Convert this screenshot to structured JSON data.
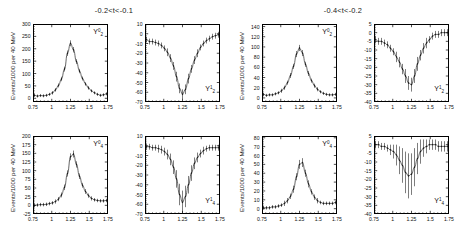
{
  "figure": {
    "ylabel_text": "Events/1000 per 40 MeV",
    "xtick_labels": [
      "0.75",
      "1",
      "1.25",
      "1.5",
      "1.75"
    ],
    "xlim": [
      0.75,
      1.75
    ]
  },
  "groups": [
    {
      "title": "-0.2<t<-0.1",
      "panels": [
        {
          "moment_base": "Y",
          "moment_l": "2",
          "moment_m": "0",
          "yticks": [
            "300",
            "250",
            "200",
            "150",
            "100",
            "50",
            "0"
          ],
          "ylim": [
            -15,
            300
          ],
          "chart_data": {
            "type": "line",
            "title": "Y20 moment, -0.2<t<-0.1",
            "xlabel": "",
            "ylabel": "Events/1000 per 40 MeV",
            "xlim": [
              0.75,
              1.75
            ],
            "ylim": [
              -15,
              300
            ],
            "x": [
              0.77,
              0.81,
              0.85,
              0.89,
              0.93,
              0.97,
              1.01,
              1.05,
              1.09,
              1.13,
              1.17,
              1.21,
              1.25,
              1.29,
              1.33,
              1.37,
              1.41,
              1.45,
              1.49,
              1.53,
              1.57,
              1.61,
              1.65,
              1.69,
              1.73
            ],
            "values": [
              12,
              9,
              11,
              10,
              12,
              16,
              22,
              34,
              52,
              78,
              118,
              182,
              222,
              196,
              148,
              110,
              80,
              58,
              42,
              30,
              22,
              16,
              12,
              14,
              18
            ],
            "errors": [
              6,
              6,
              6,
              6,
              6,
              6,
              7,
              7,
              8,
              9,
              10,
              11,
              12,
              11,
              10,
              9,
              8,
              7,
              7,
              6,
              6,
              6,
              6,
              6,
              6
            ]
          }
        },
        {
          "moment_base": "Y",
          "moment_l": "2",
          "moment_m": "1",
          "yticks": [
            "10",
            "0",
            "-10",
            "-20",
            "-30",
            "-40",
            "-50",
            "-60",
            "-70"
          ],
          "ylim": [
            -70,
            10
          ],
          "chart_data": {
            "type": "line",
            "title": "Y21 moment, -0.2<t<-0.1",
            "xlabel": "",
            "ylabel": "Events/1000 per 40 MeV",
            "xlim": [
              0.75,
              1.75
            ],
            "ylim": [
              -70,
              10
            ],
            "x": [
              0.77,
              0.81,
              0.85,
              0.89,
              0.93,
              0.97,
              1.01,
              1.05,
              1.09,
              1.13,
              1.17,
              1.21,
              1.25,
              1.29,
              1.33,
              1.37,
              1.41,
              1.45,
              1.49,
              1.53,
              1.57,
              1.61,
              1.65,
              1.69,
              1.73
            ],
            "values": [
              -6,
              -8,
              -8,
              -9,
              -10,
              -12,
              -15,
              -19,
              -25,
              -33,
              -44,
              -56,
              -62,
              -57,
              -46,
              -36,
              -27,
              -20,
              -14,
              -10,
              -7,
              -5,
              -3,
              -2,
              -1
            ],
            "errors": [
              3,
              3,
              3,
              3,
              3,
              3,
              3,
              4,
              4,
              4,
              5,
              5,
              5,
              5,
              5,
              4,
              4,
              4,
              3,
              3,
              3,
              3,
              3,
              3,
              3
            ]
          }
        },
        {
          "moment_base": "Y",
          "moment_l": "4",
          "moment_m": "0",
          "yticks": [
            "200",
            "175",
            "150",
            "125",
            "100",
            "75",
            "50",
            "25",
            "0",
            "-25"
          ],
          "ylim": [
            -25,
            200
          ],
          "chart_data": {
            "type": "line",
            "title": "Y40 moment, -0.2<t<-0.1",
            "xlabel": "",
            "ylabel": "Events/1000 per 40 MeV",
            "xlim": [
              0.75,
              1.75
            ],
            "ylim": [
              -25,
              200
            ],
            "x": [
              0.77,
              0.81,
              0.85,
              0.89,
              0.93,
              0.97,
              1.01,
              1.05,
              1.09,
              1.13,
              1.17,
              1.21,
              1.25,
              1.29,
              1.33,
              1.37,
              1.41,
              1.45,
              1.49,
              1.53,
              1.57,
              1.61,
              1.65,
              1.69,
              1.73
            ],
            "values": [
              0,
              1,
              2,
              2,
              3,
              5,
              7,
              11,
              18,
              30,
              52,
              92,
              140,
              148,
              118,
              84,
              58,
              40,
              28,
              20,
              16,
              14,
              13,
              13,
              14
            ],
            "errors": [
              5,
              5,
              5,
              5,
              5,
              5,
              5,
              6,
              6,
              7,
              8,
              9,
              10,
              10,
              9,
              8,
              7,
              7,
              6,
              6,
              5,
              5,
              5,
              5,
              5
            ]
          }
        },
        {
          "moment_base": "Y",
          "moment_l": "4",
          "moment_m": "1",
          "yticks": [
            "10",
            "0",
            "-10",
            "-20",
            "-30",
            "-40",
            "-50",
            "-60",
            "-70"
          ],
          "ylim": [
            -70,
            10
          ],
          "chart_data": {
            "type": "line",
            "title": "Y41 moment, -0.2<t<-0.1",
            "xlabel": "",
            "ylabel": "Events/1000 per 40 MeV",
            "xlim": [
              0.75,
              1.75
            ],
            "ylim": [
              -70,
              10
            ],
            "x": [
              0.77,
              0.81,
              0.85,
              0.89,
              0.93,
              0.97,
              1.01,
              1.05,
              1.09,
              1.13,
              1.17,
              1.21,
              1.25,
              1.29,
              1.33,
              1.37,
              1.41,
              1.45,
              1.49,
              1.53,
              1.57,
              1.61,
              1.65,
              1.69,
              1.73
            ],
            "values": [
              -1,
              -1,
              -2,
              -2,
              -3,
              -4,
              -6,
              -9,
              -14,
              -22,
              -34,
              -50,
              -58,
              -52,
              -40,
              -28,
              -18,
              -12,
              -8,
              -5,
              -3,
              -2,
              -2,
              -2,
              -2
            ],
            "errors": [
              3,
              3,
              3,
              3,
              4,
              4,
              4,
              5,
              6,
              7,
              9,
              11,
              12,
              11,
              9,
              8,
              6,
              5,
              4,
              4,
              3,
              3,
              3,
              3,
              3
            ]
          }
        }
      ]
    },
    {
      "title": "-0.4<t<-0.2",
      "panels": [
        {
          "moment_base": "Y",
          "moment_l": "2",
          "moment_m": "0",
          "yticks": [
            "140",
            "120",
            "100",
            "80",
            "60",
            "40",
            "20",
            "0"
          ],
          "ylim": [
            -8,
            145
          ],
          "chart_data": {
            "type": "line",
            "title": "Y20 moment, -0.4<t<-0.2",
            "xlabel": "",
            "ylabel": "Events/1000 per 40 MeV",
            "xlim": [
              0.75,
              1.75
            ],
            "ylim": [
              -8,
              145
            ],
            "x": [
              0.77,
              0.81,
              0.85,
              0.89,
              0.93,
              0.97,
              1.01,
              1.05,
              1.09,
              1.13,
              1.17,
              1.21,
              1.25,
              1.29,
              1.33,
              1.37,
              1.41,
              1.45,
              1.49,
              1.53,
              1.57,
              1.61,
              1.65,
              1.69,
              1.73
            ],
            "values": [
              7,
              5,
              6,
              6,
              8,
              10,
              14,
              20,
              30,
              44,
              62,
              86,
              98,
              88,
              66,
              48,
              34,
              24,
              17,
              12,
              9,
              7,
              6,
              6,
              7
            ],
            "errors": [
              3,
              3,
              3,
              3,
              3,
              3,
              4,
              4,
              4,
              5,
              5,
              6,
              6,
              6,
              5,
              5,
              4,
              4,
              4,
              3,
              3,
              3,
              3,
              3,
              3
            ]
          }
        },
        {
          "moment_base": "Y",
          "moment_l": "2",
          "moment_m": "1",
          "yticks": [
            "5",
            "0",
            "-5",
            "-10",
            "-15",
            "-20",
            "-25",
            "-30",
            "-35",
            "-40"
          ],
          "ylim": [
            -40,
            5
          ],
          "chart_data": {
            "type": "line",
            "title": "Y21 moment, -0.4<t<-0.2",
            "xlabel": "",
            "ylabel": "Events/1000 per 40 MeV",
            "xlim": [
              0.75,
              1.75
            ],
            "ylim": [
              -40,
              5
            ],
            "x": [
              0.77,
              0.81,
              0.85,
              0.89,
              0.93,
              0.97,
              1.01,
              1.05,
              1.09,
              1.13,
              1.17,
              1.21,
              1.25,
              1.29,
              1.33,
              1.37,
              1.41,
              1.45,
              1.49,
              1.53,
              1.57,
              1.61,
              1.65,
              1.69,
              1.73
            ],
            "values": [
              -4,
              -5,
              -5,
              -6,
              -7,
              -9,
              -11,
              -14,
              -17,
              -21,
              -25,
              -29,
              -30,
              -25,
              -18,
              -13,
              -9,
              -6,
              -4,
              -2,
              -1,
              -1,
              0,
              0,
              0
            ],
            "errors": [
              2,
              2,
              2,
              2,
              2,
              2,
              2,
              3,
              3,
              3,
              4,
              4,
              4,
              4,
              4,
              3,
              3,
              3,
              2,
              2,
              2,
              2,
              2,
              2,
              2
            ]
          }
        },
        {
          "moment_base": "Y",
          "moment_l": "4",
          "moment_m": "0",
          "yticks": [
            "80",
            "70",
            "60",
            "50",
            "40",
            "30",
            "20",
            "10",
            "0"
          ],
          "ylim": [
            -6,
            82
          ],
          "chart_data": {
            "type": "line",
            "title": "Y40 moment, -0.4<t<-0.2",
            "xlabel": "",
            "ylabel": "Events/1000 per 40 MeV",
            "xlim": [
              0.75,
              1.75
            ],
            "ylim": [
              -6,
              82
            ],
            "x": [
              0.77,
              0.81,
              0.85,
              0.89,
              0.93,
              0.97,
              1.01,
              1.05,
              1.09,
              1.13,
              1.17,
              1.21,
              1.25,
              1.29,
              1.33,
              1.37,
              1.41,
              1.45,
              1.49,
              1.53,
              1.57,
              1.61,
              1.65,
              1.69,
              1.73
            ],
            "values": [
              1,
              1,
              1,
              2,
              2,
              3,
              4,
              6,
              9,
              14,
              22,
              36,
              50,
              52,
              40,
              28,
              19,
              13,
              9,
              7,
              6,
              6,
              6,
              6,
              7
            ],
            "errors": [
              2,
              2,
              2,
              2,
              2,
              2,
              2,
              3,
              3,
              3,
              4,
              4,
              5,
              5,
              4,
              4,
              3,
              3,
              3,
              2,
              2,
              2,
              2,
              2,
              2
            ]
          }
        },
        {
          "moment_base": "Y",
          "moment_l": "4",
          "moment_m": "1",
          "yticks": [
            "5",
            "0",
            "-5",
            "-10",
            "-15",
            "-20",
            "-25",
            "-30",
            "-35",
            "-40"
          ],
          "ylim": [
            -40,
            5
          ],
          "chart_data": {
            "type": "line",
            "title": "Y41 moment, -0.4<t<-0.2",
            "xlabel": "",
            "ylabel": "Events/1000 per 40 MeV",
            "xlim": [
              0.75,
              1.75
            ],
            "ylim": [
              -40,
              5
            ],
            "x": [
              0.77,
              0.81,
              0.85,
              0.89,
              0.93,
              0.97,
              1.01,
              1.05,
              1.09,
              1.13,
              1.17,
              1.21,
              1.25,
              1.29,
              1.33,
              1.37,
              1.41,
              1.45,
              1.49,
              1.53,
              1.57,
              1.61,
              1.65,
              1.69,
              1.73
            ],
            "values": [
              0,
              0,
              -1,
              -1,
              -2,
              -3,
              -4,
              -6,
              -9,
              -12,
              -16,
              -18,
              -17,
              -13,
              -8,
              -4,
              -2,
              -1,
              0,
              0,
              0,
              -1,
              -1,
              -1,
              -1
            ],
            "errors": [
              2,
              2,
              2,
              2,
              2,
              3,
              4,
              6,
              8,
              10,
              12,
              13,
              12,
              11,
              9,
              7,
              5,
              4,
              3,
              3,
              3,
              3,
              3,
              3,
              3
            ]
          }
        }
      ]
    }
  ]
}
